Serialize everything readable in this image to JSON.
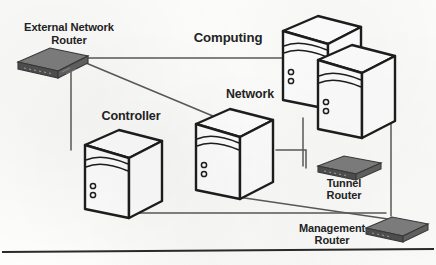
{
  "diagram": {
    "type": "network-architecture-diagram",
    "medium": "scanned black-and-white line drawing",
    "nodes": [
      {
        "id": "external-network-router",
        "label": "External Network\nRouter",
        "kind": "router",
        "label_position": "above"
      },
      {
        "id": "computing",
        "label": "Computing",
        "kind": "server-tower-pair",
        "label_position": "left"
      },
      {
        "id": "network",
        "label": "Network",
        "kind": "server-tower",
        "label_position": "above-left"
      },
      {
        "id": "controller",
        "label": "Controller",
        "kind": "server-tower",
        "label_position": "above"
      },
      {
        "id": "tunnel-router",
        "label": "Tunnel\nRouter",
        "kind": "router",
        "label_position": "below"
      },
      {
        "id": "management-router",
        "label": "Management\nRouter",
        "kind": "router",
        "label_position": "left"
      }
    ],
    "links": [
      {
        "from": "external-network-router",
        "to": "computing"
      },
      {
        "from": "external-network-router",
        "to": "network"
      },
      {
        "from": "external-network-router",
        "to": "controller"
      },
      {
        "from": "computing",
        "to": "tunnel-router"
      },
      {
        "from": "computing",
        "to": "management-router"
      },
      {
        "from": "network",
        "to": "tunnel-router"
      },
      {
        "from": "network",
        "to": "management-router"
      },
      {
        "from": "controller",
        "to": "management-router"
      }
    ],
    "colors": {
      "ink": "#1d1d1d",
      "line": "#5a5a5a",
      "router_fill": "#6d6d6d",
      "router_top": "#7e7e7e",
      "router_side": "#4a4a4a",
      "tower_fill": "#ffffff",
      "paper": "#fdfdfc",
      "rule": "#2a2a2a"
    }
  },
  "labels": {
    "external_network_router": "External Network\nRouter",
    "computing": "Computing",
    "network": "Network",
    "controller": "Controller",
    "tunnel_router": "Tunnel\nRouter",
    "management_router": "Management\nRouter"
  }
}
